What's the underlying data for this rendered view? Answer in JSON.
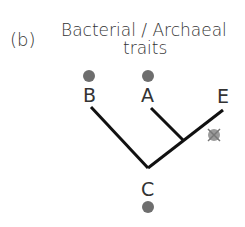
{
  "panel_label": "(b)",
  "title_line1": "Bacterial / Archaeal",
  "title_line2": "traits",
  "nodes": {
    "A": {
      "label": "A",
      "trait": "present"
    },
    "B": {
      "label": "B",
      "trait": "present"
    },
    "C": {
      "label": "C",
      "trait": "present"
    },
    "E": {
      "label": "E",
      "trait": "lost"
    }
  },
  "colors": {
    "dot": "#6e6e6e",
    "line": "#111111",
    "lost_marker": "#9a9a9a"
  }
}
